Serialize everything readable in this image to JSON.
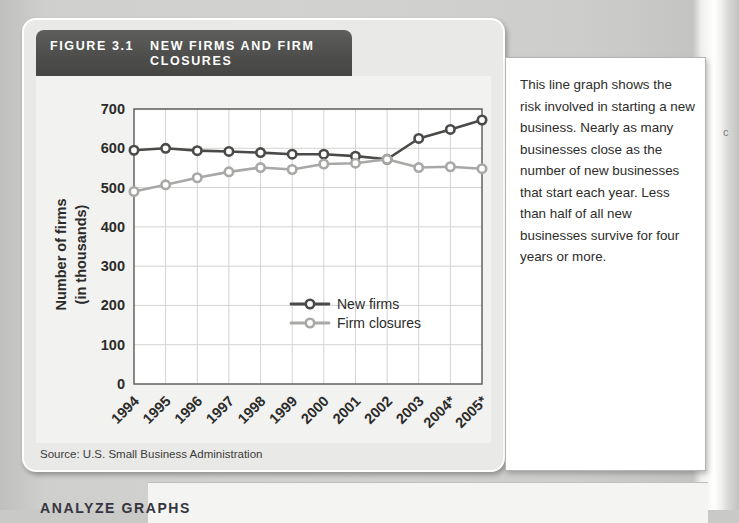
{
  "figure": {
    "number": "FIGURE 3.1",
    "title": "NEW FIRMS AND FIRM CLOSURES",
    "source": "Source: U.S. Small Business Administration"
  },
  "note": {
    "text": "This line graph shows the risk involved in starting a new business. Nearly as many businesses close as the number of new businesses that start each year. Less than half of all new businesses survive for four years or more."
  },
  "bottom": {
    "heading": "ANALYZE GRAPHS"
  },
  "colors": {
    "new_firms": "#4a4a48",
    "firm_closures": "#a8a8a6",
    "header_bg": "#4e4e4c",
    "plot_bg": "#f2f2f0",
    "grid": "#d3d3d1"
  },
  "chart_data": {
    "type": "line",
    "title": "NEW FIRMS AND FIRM CLOSURES",
    "xlabel": "Year",
    "ylabel": "Number of firms (in thousands)",
    "footnote": "*Estimated",
    "grid": true,
    "legend_position": "inside-lower-right",
    "ylim": [
      0,
      700
    ],
    "yticks": [
      0,
      100,
      200,
      300,
      400,
      500,
      600,
      700
    ],
    "categories": [
      "1994",
      "1995",
      "1996",
      "1997",
      "1998",
      "1999",
      "2000",
      "2001",
      "2002",
      "2003",
      "2004*",
      "2005*"
    ],
    "series": [
      {
        "name": "New firms",
        "color": "#4a4a48",
        "values": [
          595,
          600,
          594,
          592,
          589,
          585,
          585,
          580,
          572,
          625,
          648,
          672
        ]
      },
      {
        "name": "Firm closures",
        "color": "#a8a8a6",
        "values": [
          490,
          507,
          525,
          540,
          551,
          546,
          560,
          562,
          572,
          551,
          553,
          548
        ]
      }
    ]
  }
}
